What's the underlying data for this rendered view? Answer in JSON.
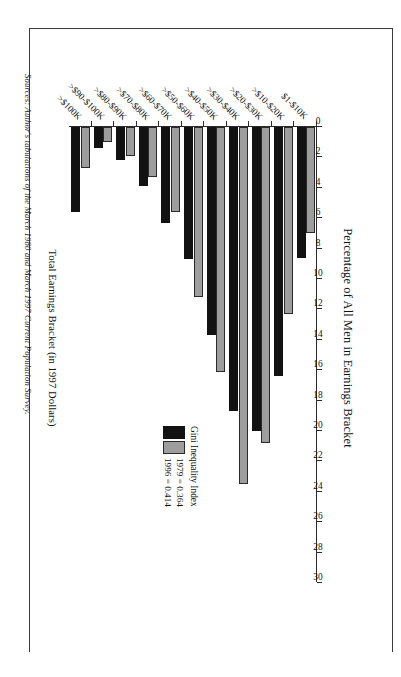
{
  "figure": {
    "source_note": "Sources: Author's tabulations of the March 1980 and March 1997 Current Population Survey."
  },
  "chart_data": {
    "type": "bar",
    "orientation": "horizontal",
    "title": "Percentage of All Men in Earnings Bracket",
    "xlabel": "Percentage of All Men in Earnings Bracket",
    "ylabel": "Total Earnings Bracket (in 1997 Dollars)",
    "xlim": [
      0,
      30
    ],
    "xticks": [
      0,
      2,
      4,
      6,
      8,
      10,
      12,
      14,
      16,
      18,
      20,
      22,
      24,
      26,
      28,
      30
    ],
    "grid": false,
    "legend_position": "inside-right",
    "legend_title": "Gini Inequality Index",
    "categories": [
      "$1-$10K",
      ">$10-$20K",
      ">$20-$30K",
      ">$30-$40K",
      ">$40-$50K",
      ">$50-$60K",
      ">$60-$70K",
      ">$70-$80K",
      ">$80-$90K",
      ">$90-$100K",
      ">$100K"
    ],
    "series": [
      {
        "name": "1979 = 0.364",
        "year": "1979",
        "gini": "0.364",
        "color": "#9d9d9d",
        "values": [
          7.0,
          12.3,
          20.8,
          23.5,
          16.1,
          11.2,
          5.6,
          3.3,
          1.9,
          1.0,
          2.7
        ]
      },
      {
        "name": "1996 = 0.414",
        "year": "1996",
        "gini": "0.414",
        "color": "#121212",
        "values": [
          8.6,
          16.4,
          20.0,
          18.7,
          13.7,
          8.7,
          6.3,
          3.9,
          2.2,
          1.4,
          5.6
        ]
      }
    ]
  }
}
